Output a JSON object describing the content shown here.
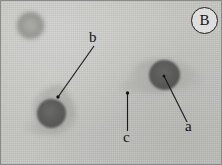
{
  "figure": {
    "panel_letter": "B",
    "caption_type": "blood-smear-micrograph",
    "background_color": "#c7c7c4",
    "labels": [
      {
        "id": "a",
        "text": "a",
        "target": "nucleus of right cell",
        "label_x": 186,
        "label_y": 130,
        "dot_x": 163,
        "dot_y": 75
      },
      {
        "id": "b",
        "text": "b",
        "target": "cytoplasm of left cell",
        "label_x": 88,
        "label_y": 54,
        "dot_x": 57,
        "dot_y": 96
      },
      {
        "id": "c",
        "text": "c",
        "target": "pale cytoplasmic tail",
        "label_x": 123,
        "label_y": 141,
        "dot_x": 126,
        "dot_y": 92
      }
    ]
  },
  "cells": [
    {
      "name": "red-blood-cell",
      "x": 29,
      "y": 24,
      "radius": 13,
      "color": "#9a9a97"
    },
    {
      "name": "left-leukocyte-nucleus",
      "x": 50,
      "y": 112,
      "radius": 14,
      "color": "#5a5a58"
    },
    {
      "name": "right-leukocyte-nucleus",
      "x": 163,
      "y": 74,
      "radius": 15,
      "color": "#575755"
    }
  ],
  "colors": {
    "background": "#c7c7c4",
    "nucleus": "#575755",
    "cytoplasm": "#b0b0ad",
    "border": "#8a8a88",
    "label_text": "#141414"
  }
}
